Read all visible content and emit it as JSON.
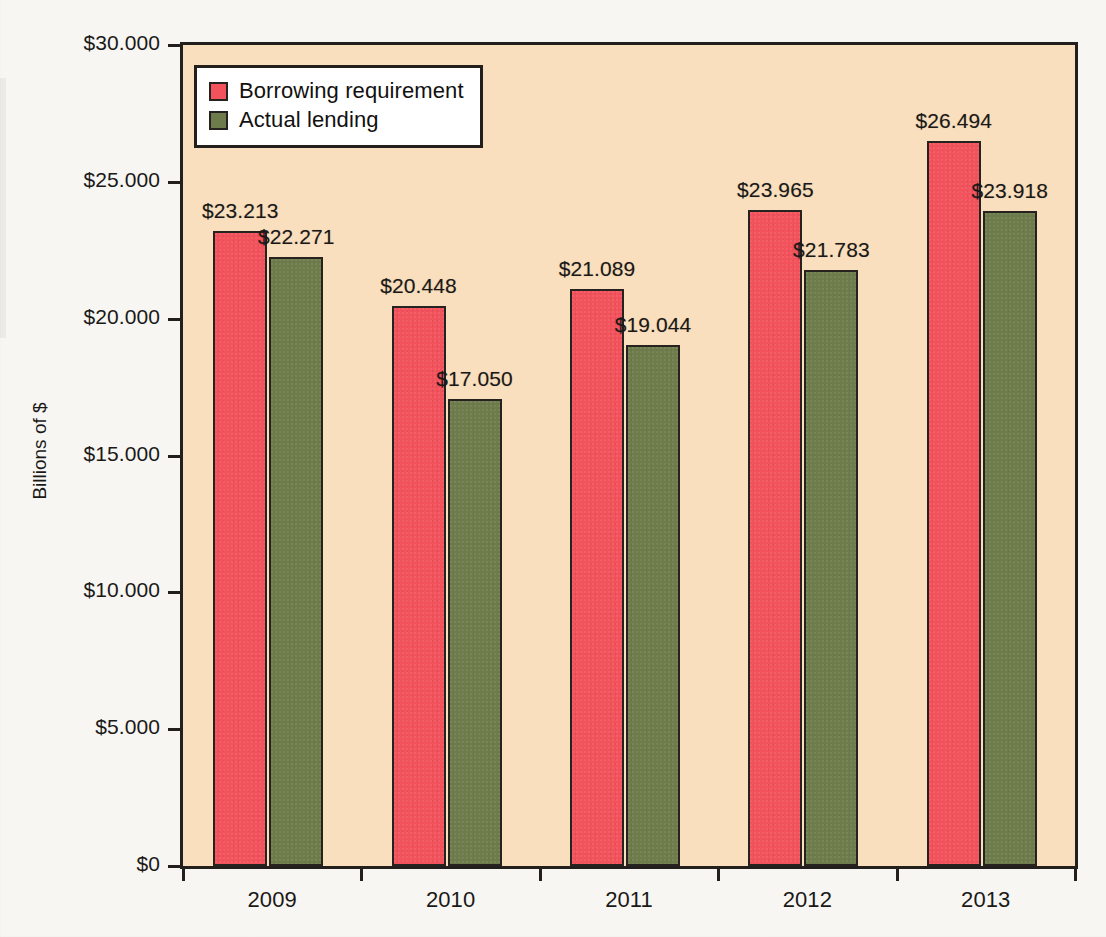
{
  "chart_data": {
    "type": "bar",
    "title": "",
    "xlabel": "",
    "ylabel": "Billions of $",
    "categories": [
      "2009",
      "2010",
      "2011",
      "2012",
      "2013"
    ],
    "series": [
      {
        "name": "Borrowing requirement",
        "color": "#f2525c",
        "values": [
          23.213,
          20.448,
          21.089,
          23.965,
          26.494
        ],
        "labels": [
          "$23.213",
          "$20.448",
          "$21.089",
          "$23.965",
          "$26.494"
        ]
      },
      {
        "name": "Actual lending",
        "color": "#6e7c4b",
        "values": [
          22.271,
          17.05,
          19.044,
          21.783,
          23.918
        ],
        "labels": [
          "$22.271",
          "$17.050",
          "$19.044",
          "$21.783",
          "$23.918"
        ]
      }
    ],
    "ylim": [
      0,
      30
    ],
    "yticks": [
      0,
      5,
      10,
      15,
      20,
      25,
      30
    ],
    "ytick_labels": [
      "$0",
      "$5.000",
      "$10.000",
      "$15.000",
      "$20.000",
      "$25.000",
      "$30.000"
    ],
    "grid": false,
    "legend_position": "top-left",
    "plot_background": "#f9dfbe",
    "page_background": "#f7f6f3"
  },
  "legend": {
    "items": [
      {
        "label": "Borrowing requirement"
      },
      {
        "label": "Actual lending"
      }
    ]
  },
  "axis": {
    "y_title": "Billions of $"
  }
}
